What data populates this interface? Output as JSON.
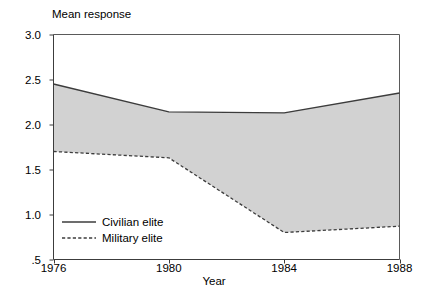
{
  "chart_data": {
    "type": "line",
    "title": "",
    "ylabel": "Mean response",
    "xlabel": "Year",
    "x": [
      1976,
      1980,
      1984,
      1988
    ],
    "xtick_labels": [
      "1976",
      "1980",
      "1984",
      "1988"
    ],
    "xlim": [
      1976,
      1988
    ],
    "ylim": [
      0.5,
      3.0
    ],
    "ytick_values": [
      3.0,
      2.5,
      2.0,
      1.5,
      1.0,
      0.5
    ],
    "ytick_labels": [
      "3.0",
      "2.5",
      "2.0",
      "1.5",
      "1.0",
      ".5"
    ],
    "grid": false,
    "legend_position": "inside-lower-left",
    "fill_between": true,
    "fill_color": "#d2d2d2",
    "series": [
      {
        "name": "Civilian elite",
        "style": "solid",
        "color": "#3c3c3c",
        "values": [
          2.45,
          2.14,
          2.13,
          2.35
        ]
      },
      {
        "name": "Military elite",
        "style": "dashed",
        "color": "#3c3c3c",
        "values": [
          1.7,
          1.63,
          0.8,
          0.87
        ]
      }
    ]
  },
  "legend": {
    "items": [
      {
        "label": "Civilian elite",
        "style": "solid"
      },
      {
        "label": "Military elite",
        "style": "dashed"
      }
    ]
  }
}
